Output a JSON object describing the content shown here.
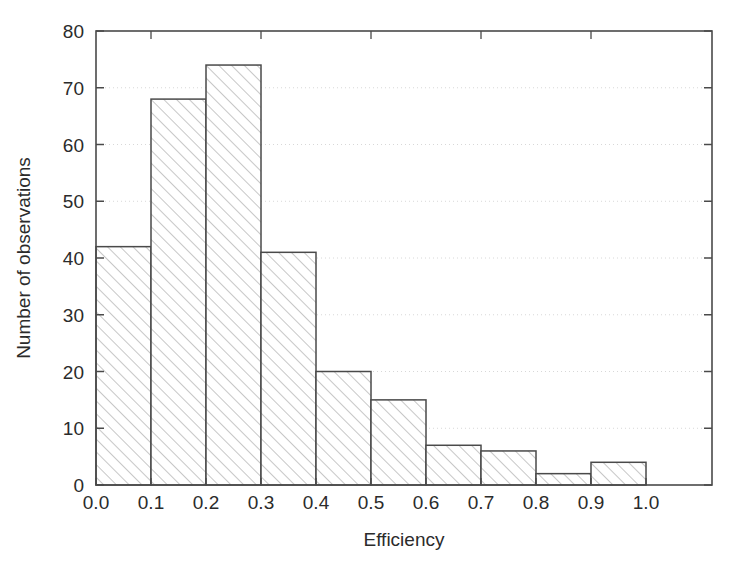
{
  "chart_data": {
    "type": "bar",
    "title": "",
    "subtitle": "",
    "xlabel": "Efficiency",
    "ylabel": "Number of observations",
    "xlim": [
      0.0,
      1.12
    ],
    "ylim": [
      0,
      80
    ],
    "bin_width": 0.1,
    "grid": true,
    "grid_style": "dotted-horizontal",
    "legend": "none",
    "categories": [
      "0.0-0.1",
      "0.1-0.2",
      "0.2-0.3",
      "0.3-0.4",
      "0.4-0.5",
      "0.5-0.6",
      "0.6-0.7",
      "0.7-0.8",
      "0.8-0.9",
      "0.9-1.0"
    ],
    "bin_edges": [
      0.0,
      0.1,
      0.2,
      0.3,
      0.4,
      0.5,
      0.6,
      0.7,
      0.8,
      0.9,
      1.0
    ],
    "values": [
      42,
      68,
      74,
      41,
      20,
      15,
      7,
      6,
      2,
      4
    ],
    "xticks": [
      0.0,
      0.1,
      0.2,
      0.3,
      0.4,
      0.5,
      0.6,
      0.7,
      0.8,
      0.9,
      1.0
    ],
    "xticklabels": [
      "0.0",
      "0.1",
      "0.2",
      "0.3",
      "0.4",
      "0.5",
      "0.6",
      "0.7",
      "0.8",
      "0.9",
      "1.0"
    ],
    "yticks": [
      0,
      10,
      20,
      30,
      40,
      50,
      60,
      70,
      80
    ],
    "yticklabels": [
      "0",
      "10",
      "20",
      "30",
      "40",
      "50",
      "60",
      "70",
      "80"
    ],
    "bar_fill": "#ffffff",
    "bar_edge": "#4a4a4a",
    "hatch": "diagonal-forward",
    "hatch_color": "#b4b4b4",
    "grid_color": "#d8d8d8",
    "axis_color": "#4a4a4a",
    "text_color": "#2b2b2b"
  }
}
